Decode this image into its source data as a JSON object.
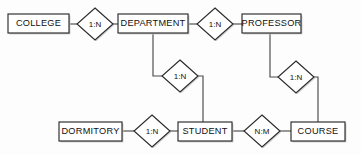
{
  "diagram": {
    "type": "entity-relationship-diagram",
    "title": "",
    "background_color": "#fdfdfd",
    "line_color": "#4b4b4b",
    "border_color": "#2b2b2b",
    "shadow_color": "#c9c9c9",
    "text_color": "#111111",
    "entities": [
      {
        "id": "college",
        "label": "COLLEGE",
        "x": 8,
        "y": 14,
        "w": 61,
        "h": 19
      },
      {
        "id": "department",
        "label": "DEPARTMENT",
        "x": 118,
        "y": 14,
        "w": 70,
        "h": 19
      },
      {
        "id": "professor",
        "label": "PROFESSOR",
        "x": 242,
        "y": 14,
        "w": 59,
        "h": 19
      },
      {
        "id": "dormitory",
        "label": "DORMITORY",
        "x": 59,
        "y": 122,
        "w": 63,
        "h": 19
      },
      {
        "id": "student",
        "label": "STUDENT",
        "x": 178,
        "y": 122,
        "w": 54,
        "h": 19
      },
      {
        "id": "course",
        "label": "COURSE",
        "x": 291,
        "y": 122,
        "w": 54,
        "h": 19
      }
    ],
    "relationships": [
      {
        "id": "college-department",
        "label": "1:N",
        "cx": 95,
        "cy": 24,
        "rx": 18,
        "ry": 16,
        "from": "college",
        "to": "department"
      },
      {
        "id": "department-professor",
        "label": "1:N",
        "cx": 215,
        "cy": 24,
        "rx": 18,
        "ry": 16,
        "from": "department",
        "to": "professor"
      },
      {
        "id": "department-student",
        "label": "1:N",
        "cx": 180,
        "cy": 76,
        "rx": 18,
        "ry": 16,
        "from": "department",
        "to": "student"
      },
      {
        "id": "professor-course",
        "label": "1:N",
        "cx": 296,
        "cy": 77,
        "rx": 18,
        "ry": 16,
        "from": "professor",
        "to": "course"
      },
      {
        "id": "dormitory-student",
        "label": "1:N",
        "cx": 152,
        "cy": 131,
        "rx": 18,
        "ry": 16,
        "from": "dormitory",
        "to": "student"
      },
      {
        "id": "student-course",
        "label": "N:M",
        "cx": 262,
        "cy": 131,
        "rx": 18,
        "ry": 16,
        "from": "student",
        "to": "course"
      }
    ],
    "connectors": [
      {
        "id": "college-to-rel1",
        "path": "M 69 24 L 77 24"
      },
      {
        "id": "rel1-to-department",
        "path": "M 113 24 L 118 24"
      },
      {
        "id": "department-to-rel2",
        "path": "M 188 24 L 197 24"
      },
      {
        "id": "rel2-to-professor",
        "path": "M 233 24 L 242 24"
      },
      {
        "id": "department-down-rel3",
        "path": "M 153 33 L 153 76 L 162 76"
      },
      {
        "id": "rel3-down-student",
        "path": "M 198 76 L 203 76 L 203 122"
      },
      {
        "id": "professor-down-rel4",
        "path": "M 270 33 L 270 77 L 278 77"
      },
      {
        "id": "rel4-down-course",
        "path": "M 314 77 L 318 77 L 318 122"
      },
      {
        "id": "dormitory-to-rel5",
        "path": "M 122 131 L 134 131"
      },
      {
        "id": "rel5-to-student",
        "path": "M 170 131 L 178 131"
      },
      {
        "id": "student-to-rel6",
        "path": "M 232 131 L 244 131"
      },
      {
        "id": "rel6-to-course",
        "path": "M 280 131 L 291 131"
      }
    ]
  }
}
